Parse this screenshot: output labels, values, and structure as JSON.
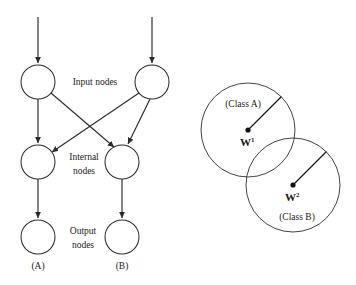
{
  "figure": {
    "colors": {
      "background": "#ffffff",
      "stroke": "#2b2b2b",
      "text": "#1a1a1a",
      "circle_outline": "#3a3a3a"
    }
  },
  "network": {
    "layer_labels": {
      "input": "Input nodes",
      "internal_line1": "Internal",
      "internal_line2": "nodes",
      "output_line1": "Output",
      "output_line2": "nodes"
    },
    "nodes": [
      {
        "id": "in-a",
        "layer": "input",
        "cx": 38,
        "cy": 82,
        "r": 17
      },
      {
        "id": "in-b",
        "layer": "input",
        "cx": 152,
        "cy": 82,
        "r": 17
      },
      {
        "id": "int-a",
        "layer": "internal",
        "cx": 38,
        "cy": 162,
        "r": 17
      },
      {
        "id": "int-b",
        "layer": "internal",
        "cx": 122,
        "cy": 162,
        "r": 17
      },
      {
        "id": "out-a",
        "layer": "output",
        "cx": 38,
        "cy": 237,
        "r": 17
      },
      {
        "id": "out-b",
        "layer": "output",
        "cx": 122,
        "cy": 237,
        "r": 17
      }
    ],
    "edges": [
      {
        "from": "external",
        "to": "in-a",
        "type": "incoming"
      },
      {
        "from": "external",
        "to": "in-b",
        "type": "incoming"
      },
      {
        "from": "in-a",
        "to": "int-a",
        "type": "straight"
      },
      {
        "from": "in-a",
        "to": "int-b",
        "type": "crossing"
      },
      {
        "from": "in-b",
        "to": "int-a",
        "type": "crossing"
      },
      {
        "from": "in-b",
        "to": "int-b",
        "type": "straight"
      },
      {
        "from": "int-a",
        "to": "out-a",
        "type": "straight"
      },
      {
        "from": "int-b",
        "to": "out-b",
        "type": "straight"
      }
    ],
    "output_labels": [
      {
        "id": "label-a",
        "text": "(A)",
        "x": 38,
        "y": 268
      },
      {
        "id": "label-b",
        "text": "(B)",
        "x": 122,
        "y": 268
      }
    ]
  },
  "class_regions": {
    "circles": [
      {
        "id": "class-a",
        "label": "(Class A)",
        "weight_symbol": "W",
        "weight_superscript": "1",
        "cx": 248,
        "cy": 130,
        "r": 47
      },
      {
        "id": "class-b",
        "label": "(Class B)",
        "weight_symbol": "W",
        "weight_superscript": "2",
        "cx": 293,
        "cy": 185,
        "r": 47
      }
    ]
  }
}
